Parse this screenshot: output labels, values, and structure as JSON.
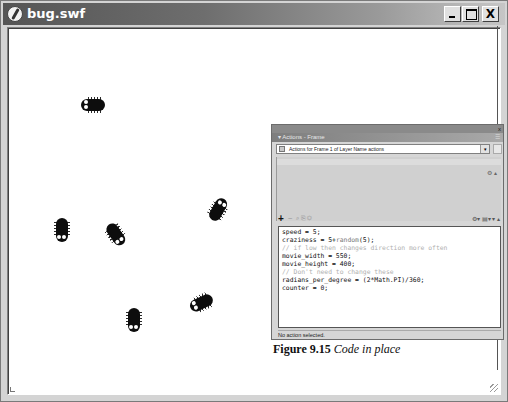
{
  "window": {
    "title": "bug.swf",
    "buttons": {
      "minimize": "_",
      "maximize": "□",
      "close": "X"
    }
  },
  "stage": {
    "background": "#ffffff",
    "bugs": [
      {
        "id": 1,
        "x": 78,
        "y": 64,
        "rotation": 90
      },
      {
        "id": 2,
        "x": 46,
        "y": 190,
        "rotation": 0
      },
      {
        "id": 3,
        "x": 100,
        "y": 195,
        "rotation": -35
      },
      {
        "id": 4,
        "x": 204,
        "y": 170,
        "rotation": 210
      },
      {
        "id": 5,
        "x": 118,
        "y": 280,
        "rotation": 0
      },
      {
        "id": 6,
        "x": 186,
        "y": 262,
        "rotation": 65
      }
    ]
  },
  "actions_panel": {
    "tab_label": "▾ Actions - Frame",
    "close_glyph": "x",
    "target_label": "Actions for Frame 1 of Layer Name actions",
    "toolbar": {
      "add": "+",
      "remove": "−",
      "tools": "⌕ ⎘ ◎",
      "right_tools": "⚙▾ ▤▾ ▾ ▴"
    },
    "script_lines": [
      {
        "text": "speed = 5;",
        "type": "code"
      },
      {
        "text": "craziness = 5+",
        "fn": "random",
        "rest": "(5);",
        "type": "mixed"
      },
      {
        "text": "// if low then changes direction more often",
        "type": "comment"
      },
      {
        "text": "movie_width = 550;",
        "type": "code"
      },
      {
        "text": "movie_height = 400;",
        "type": "code"
      },
      {
        "text": "// Don't need to change these",
        "type": "comment"
      },
      {
        "text": "radians_per_degree = (2*Math.PI)/360;",
        "type": "code"
      },
      {
        "text": "counter = 0;",
        "type": "code"
      }
    ],
    "status": "No action selected."
  },
  "caption": {
    "label": "Figure 9.15",
    "text": "Code in place"
  }
}
